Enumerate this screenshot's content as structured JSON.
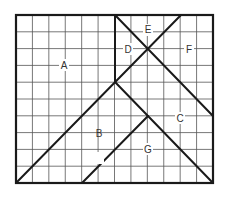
{
  "diagram": {
    "grid": {
      "columns": 12,
      "rows": 10
    },
    "regions": [
      {
        "id": "A",
        "label": "A"
      },
      {
        "id": "B",
        "label": "B"
      },
      {
        "id": "C",
        "label": "C"
      },
      {
        "id": "D",
        "label": "D"
      },
      {
        "id": "E",
        "label": "E"
      },
      {
        "id": "F",
        "label": "F"
      },
      {
        "id": "G",
        "label": "G"
      }
    ],
    "colors": {
      "lines": "#1a1a1a",
      "grid": "#555555",
      "background": "#ffffff",
      "text": "#333333"
    }
  }
}
